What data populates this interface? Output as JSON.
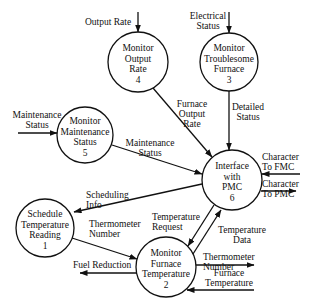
{
  "nodes": [
    {
      "id": "1",
      "lines": [
        "Schedule",
        "Temperature",
        "Reading",
        "1"
      ]
    },
    {
      "id": "2",
      "lines": [
        "Monitor",
        "Furnace",
        "Temperature",
        "2"
      ]
    },
    {
      "id": "3",
      "lines": [
        "Monitor",
        "Troublesome",
        "Furnace",
        "3"
      ]
    },
    {
      "id": "4",
      "lines": [
        "Monitor",
        "Output",
        "Rate",
        "4"
      ]
    },
    {
      "id": "5",
      "lines": [
        "Monitor",
        "Maintenance",
        "Status",
        "5"
      ]
    },
    {
      "id": "6",
      "lines": [
        "Interface",
        "with",
        "PMC",
        "6"
      ]
    }
  ],
  "flows": {
    "output_rate": [
      "Output Rate"
    ],
    "electrical_status": [
      "Electrical",
      "Status"
    ],
    "maintenance_status_in": [
      "Maintenance",
      "Status"
    ],
    "furnace_output_rate": [
      "Furnace",
      "Output",
      "Rate"
    ],
    "detailed_status": [
      "Detailed",
      "Status"
    ],
    "maintenance_status": [
      "Maintenance",
      "Status"
    ],
    "character_to_fmc": [
      "Character",
      "To FMC"
    ],
    "character_to_pmc": [
      "Character",
      "To PMC"
    ],
    "scheduling_info": [
      "Scheduling",
      "Info"
    ],
    "thermometer_number_1": [
      "Thermometer",
      "Number"
    ],
    "temperature_request": [
      "Temperature",
      "Request"
    ],
    "temperature_data": [
      "Temperature",
      "Data"
    ],
    "fuel_reduction": [
      "Fuel Reduction"
    ],
    "thermometer_number_2": [
      "Thermometer",
      "Number"
    ],
    "furnace_temperature": [
      "Furnace",
      "Temperature"
    ]
  }
}
